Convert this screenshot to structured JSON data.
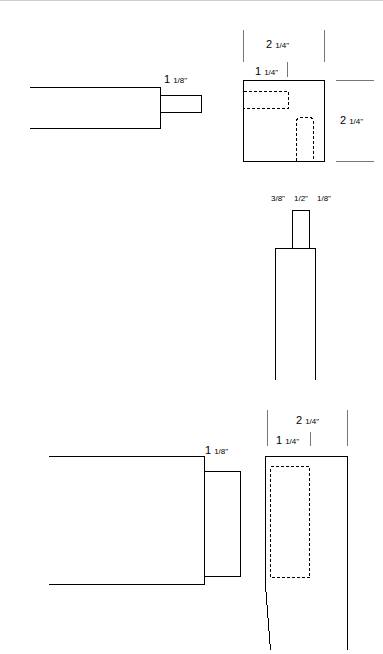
{
  "views": {
    "top_tenon_side": {
      "label": "tenon-length",
      "dimension_whole": "1",
      "dimension_frac": "1/8\""
    },
    "top_mortise_end": {
      "width_whole": "2",
      "width_frac": "1/4\"",
      "offset_whole": "1",
      "offset_frac": "1/4\"",
      "height_whole": "2",
      "height_frac": "1/4\""
    },
    "tenon_front": {
      "left_shoulder": "3/8\"",
      "tenon_width": "1/2\"",
      "right_shoulder": "1/8\""
    },
    "bottom_tenon_side": {
      "dimension_whole": "1",
      "dimension_frac": "1/8\""
    },
    "bottom_mortise_side": {
      "width_whole": "2",
      "width_frac": "1/4\"",
      "offset_whole": "1",
      "offset_frac": "1/4\""
    }
  }
}
